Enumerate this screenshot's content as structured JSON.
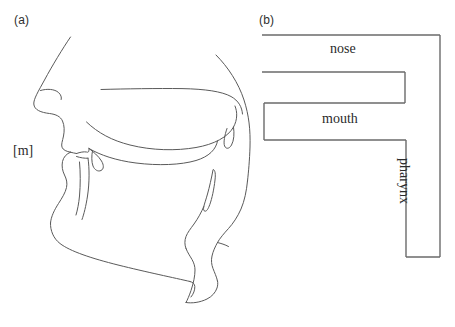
{
  "figure": {
    "title_visible": false,
    "background_color": "#ffffff",
    "stroke_color": "#5a5a5a",
    "panels": [
      {
        "id": "a",
        "label": "(a)",
        "kind": "midsagittal-vocal-tract-diagram",
        "annotations": [
          {
            "name": "phoneme",
            "text": "[m]"
          }
        ]
      },
      {
        "id": "b",
        "label": "(b)",
        "kind": "tube-model-schematic",
        "tubes": [
          {
            "name": "nose",
            "label": "nose",
            "orientation": "horizontal"
          },
          {
            "name": "mouth",
            "label": "mouth",
            "orientation": "horizontal"
          },
          {
            "name": "pharynx",
            "label": "pharynx",
            "orientation": "vertical",
            "text_rotation_deg": 90
          }
        ]
      }
    ]
  },
  "panel_a": {
    "label": "(a)",
    "phoneme_label": "[m]"
  },
  "panel_b": {
    "label": "(b)",
    "nose_label": "nose",
    "mouth_label": "mouth",
    "pharynx_label": "pharynx"
  }
}
